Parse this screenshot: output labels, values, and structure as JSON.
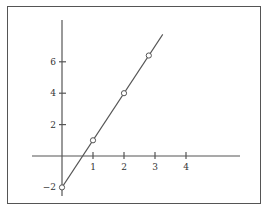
{
  "chart_data": {
    "type": "line",
    "title": "",
    "xlabel": "",
    "ylabel": "",
    "equation": "y = 3x - 2",
    "x_ticks": [
      1,
      2,
      3,
      4
    ],
    "y_ticks": [
      -2,
      2,
      4,
      6
    ],
    "x_tick_labels": [
      "1",
      "2",
      "3",
      "4"
    ],
    "y_tick_labels": [
      "−2",
      "2",
      "4",
      "6"
    ],
    "xlim": [
      -1,
      5.7
    ],
    "ylim": [
      -2.5,
      8.5
    ],
    "grid": false,
    "legend": null,
    "series": [
      {
        "name": "line",
        "line": {
          "x": [
            0,
            3.25
          ],
          "y": [
            -2,
            7.75
          ]
        },
        "marked_points": {
          "x": [
            0,
            1,
            2,
            2.8
          ],
          "y": [
            -2,
            1,
            4,
            6.4
          ]
        }
      }
    ]
  },
  "colors": {
    "axis": "#555555",
    "line": "#555555",
    "frame": "#555555",
    "marker_fill": "#ffffff"
  }
}
